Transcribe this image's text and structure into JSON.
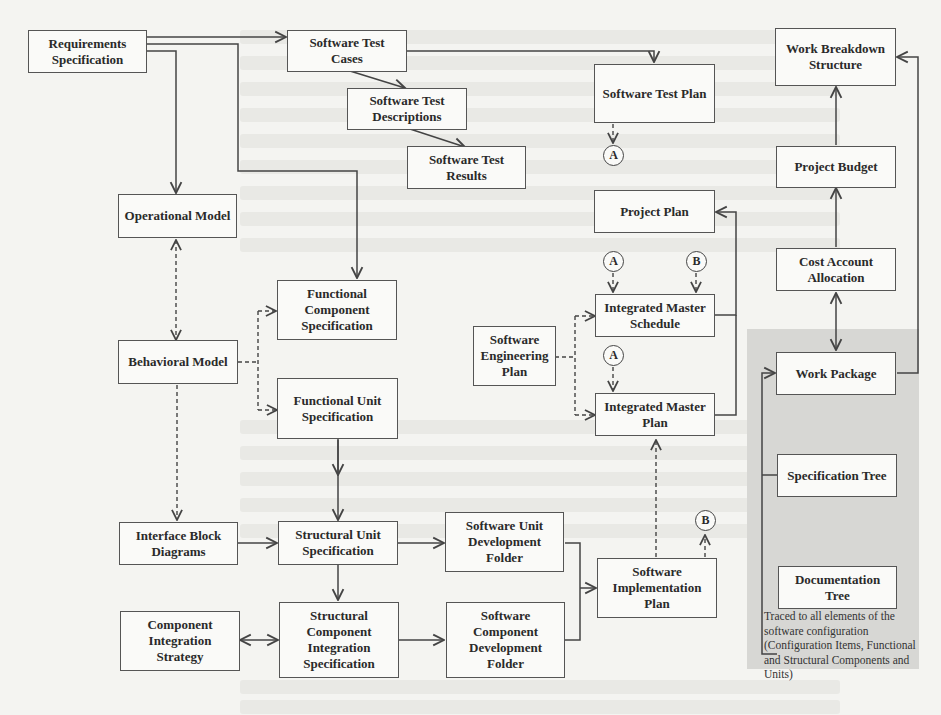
{
  "diagram": {
    "nodes": {
      "requirements_spec": "Requirements Specification",
      "sw_test_cases": "Software Test Cases",
      "sw_test_descriptions": "Software Test Descriptions",
      "sw_test_results": "Software Test Results",
      "sw_test_plan": "Software Test Plan",
      "wbs": "Work Breakdown Structure",
      "project_budget": "Project Budget",
      "project_plan": "Project Plan",
      "cost_account_allocation": "Cost Account Allocation",
      "operational_model": "Operational Model",
      "behavioral_model": "Behavioral Model",
      "functional_component_spec": "Functional Component Specification",
      "functional_unit_spec": "Functional Unit Specification",
      "sw_engineering_plan": "Software Engineering Plan",
      "integrated_master_schedule": "Integrated Master Schedule",
      "integrated_master_plan": "Integrated Master Plan",
      "work_package": "Work Package",
      "specification_tree": "Specification Tree",
      "documentation_tree": "Documentation Tree",
      "interface_block_diagrams": "Interface Block Diagrams",
      "structural_unit_spec": "Structural Unit Specification",
      "sw_unit_dev_folder": "Software Unit Development Folder",
      "sw_implementation_plan": "Software Implementation Plan",
      "component_integration_strategy": "Component Integration Strategy",
      "structural_component_integration_spec": "Structural Component Integration Specification",
      "sw_component_dev_folder": "Software Component Development Folder"
    },
    "connectors": {
      "a1": "A",
      "a2": "A",
      "a3": "A",
      "b1": "B",
      "b2": "B"
    },
    "shaded_region_note": "Traced to all elements of the software configuration (Configuration Items, Functional and Structural Components and Units)"
  }
}
